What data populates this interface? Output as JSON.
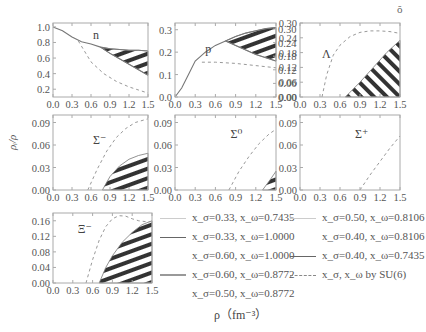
{
  "chart_data": [
    {
      "type": "line",
      "panel": "n",
      "label": "n",
      "xlim": [
        0,
        1.5
      ],
      "ylim": [
        0.1,
        1.05
      ],
      "xticks": [
        "0.0",
        "0.3",
        "0.6",
        "0.9",
        "1.2",
        "1.5"
      ],
      "yticks": [
        "0.2",
        "0.4",
        "0.6",
        "0.8",
        "1.0"
      ],
      "series": [
        {
          "name": "upper band edge",
          "x": [
            0,
            0.15,
            0.3,
            0.45,
            0.6,
            0.75,
            0.9,
            1.05,
            1.2,
            1.35,
            1.5
          ],
          "y": [
            1.0,
            0.95,
            0.87,
            0.81,
            0.78,
            0.74,
            0.72,
            0.71,
            0.7,
            0.7,
            0.69
          ]
        },
        {
          "name": "lower band edge",
          "x": [
            0.75,
            0.9,
            1.05,
            1.2,
            1.35,
            1.5
          ],
          "y": [
            0.74,
            0.66,
            0.59,
            0.52,
            0.45,
            0.38
          ]
        },
        {
          "name": "SU(6)",
          "x": [
            0.4,
            0.6,
            0.8,
            1.0,
            1.2,
            1.35,
            1.5
          ],
          "y": [
            0.82,
            0.55,
            0.4,
            0.3,
            0.23,
            0.19,
            0.15
          ]
        }
      ]
    },
    {
      "type": "line",
      "panel": "p",
      "label": "p",
      "xlim": [
        0,
        1.5
      ],
      "ylim": [
        0,
        0.33
      ],
      "xticks": [
        "0.0",
        "0.3",
        "0.6",
        "0.9",
        "1.2",
        "1.5"
      ],
      "yticks_left": [
        "0.0",
        "0.1",
        "0.2",
        "0.3"
      ],
      "yticks_right": [
        "0.00",
        "0.06",
        "0.12",
        "0.18",
        "0.24",
        "0.30"
      ],
      "series": [
        {
          "name": "upper band edge",
          "x": [
            0,
            0.1,
            0.2,
            0.3,
            0.45,
            0.6,
            0.75,
            0.9,
            1.05,
            1.2,
            1.35,
            1.5
          ],
          "y": [
            0.0,
            0.04,
            0.1,
            0.16,
            0.2,
            0.23,
            0.25,
            0.27,
            0.285,
            0.295,
            0.305,
            0.31
          ]
        },
        {
          "name": "lower band edge",
          "x": [
            0.75,
            0.9,
            1.05,
            1.2,
            1.35,
            1.5
          ],
          "y": [
            0.25,
            0.23,
            0.21,
            0.19,
            0.175,
            0.16
          ]
        },
        {
          "name": "SU(6)",
          "x": [
            0.4,
            0.6,
            0.9,
            1.2,
            1.5
          ],
          "y": [
            0.155,
            0.155,
            0.15,
            0.14,
            0.13
          ]
        }
      ]
    },
    {
      "type": "line",
      "panel": "Lambda",
      "label": "Λ",
      "xlim": [
        0,
        1.5
      ],
      "ylim": [
        0,
        0.3
      ],
      "xticks": [
        "0.0",
        "0.3",
        "0.6",
        "0.9",
        "1.2",
        "1.5"
      ],
      "yticks": [
        "0.00",
        "0.06",
        "0.12",
        "0.18",
        "0.24",
        "0.30"
      ],
      "series": [
        {
          "name": "band upper edge",
          "x": [
            0.68,
            0.9,
            1.1,
            1.3,
            1.5
          ],
          "y": [
            0.0,
            0.06,
            0.12,
            0.18,
            0.23
          ]
        },
        {
          "name": "SU(6)",
          "x": [
            0.33,
            0.4,
            0.5,
            0.6,
            0.75,
            0.9,
            1.05,
            1.2,
            1.35,
            1.5
          ],
          "y": [
            0.0,
            0.09,
            0.17,
            0.21,
            0.245,
            0.262,
            0.268,
            0.268,
            0.265,
            0.258
          ]
        }
      ]
    },
    {
      "type": "line",
      "panel": "Sigma-",
      "label": "Σ⁻",
      "xlim": [
        0,
        1.5
      ],
      "ylim": [
        0,
        0.1
      ],
      "xticks": [
        "0.0",
        "0.3",
        "0.6",
        "0.9",
        "1.2",
        "1.5"
      ],
      "yticks": [
        "0.00",
        "0.03",
        "0.06",
        "0.09"
      ],
      "series": [
        {
          "name": "band upper edge",
          "x": [
            0.78,
            0.9,
            1.05,
            1.2,
            1.35,
            1.5
          ],
          "y": [
            0.0,
            0.018,
            0.032,
            0.041,
            0.046,
            0.049
          ]
        },
        {
          "name": "SU(6)",
          "x": [
            0.55,
            0.7,
            0.85,
            1.0,
            1.15,
            1.3,
            1.5
          ],
          "y": [
            0.0,
            0.028,
            0.052,
            0.07,
            0.082,
            0.09,
            0.095
          ]
        }
      ]
    },
    {
      "type": "line",
      "panel": "Sigma0",
      "label": "Σ⁰",
      "xlim": [
        0,
        1.5
      ],
      "ylim": [
        0,
        0.1
      ],
      "xticks": [
        "0.0",
        "0.3",
        "0.6",
        "0.9",
        "1.2",
        "1.5"
      ],
      "yticks": [
        "0.00",
        "0.03",
        "0.06",
        "0.09"
      ],
      "series": [
        {
          "name": "band upper edge",
          "x": [
            1.3,
            1.4,
            1.5
          ],
          "y": [
            0.0,
            0.012,
            0.025
          ]
        },
        {
          "name": "SU(6)",
          "x": [
            0.8,
            0.95,
            1.1,
            1.25,
            1.4,
            1.5
          ],
          "y": [
            0.0,
            0.025,
            0.045,
            0.062,
            0.075,
            0.081
          ]
        }
      ]
    },
    {
      "type": "line",
      "panel": "Sigma+",
      "label": "Σ⁺",
      "xlim": [
        0,
        1.5
      ],
      "ylim": [
        0,
        0.1
      ],
      "xticks": [
        "0.0",
        "0.3",
        "0.6",
        "0.9",
        "1.2",
        "1.5"
      ],
      "yticks": [
        "0.00",
        "0.03",
        "0.06",
        "0.09"
      ],
      "series": [
        {
          "name": "SU(6)",
          "x": [
            0.9,
            1.05,
            1.2,
            1.35,
            1.5
          ],
          "y": [
            0.0,
            0.02,
            0.038,
            0.056,
            0.072
          ]
        }
      ]
    },
    {
      "type": "line",
      "panel": "Xi-",
      "label": "Ξ⁻",
      "xlim": [
        0,
        1.5
      ],
      "ylim": [
        0,
        0.18
      ],
      "xticks": [
        "0.0",
        "0.3",
        "0.6",
        "0.9",
        "1.2",
        "1.5"
      ],
      "yticks": [
        "0.00",
        "0.04",
        "0.08",
        "0.12",
        "0.16"
      ],
      "series": [
        {
          "name": "band upper edge",
          "x": [
            0.7,
            0.8,
            0.9,
            1.05,
            1.2,
            1.35,
            1.5
          ],
          "y": [
            0.0,
            0.04,
            0.07,
            0.105,
            0.13,
            0.15,
            0.16
          ]
        },
        {
          "name": "SU(6)",
          "x": [
            0.5,
            0.6,
            0.7,
            0.8,
            0.9,
            1.0,
            1.1,
            1.2,
            1.3,
            1.4,
            1.5
          ],
          "y": [
            0.0,
            0.06,
            0.11,
            0.145,
            0.165,
            0.173,
            0.172,
            0.165,
            0.16,
            0.158,
            0.158
          ]
        }
      ]
    }
  ],
  "axes": {
    "xlabel": "ρ（fm⁻³）",
    "ylabel": "ρᵢ/ρ"
  },
  "legend": {
    "col1": [
      {
        "label": "x_σ=0.33, x_ω=0.7435",
        "style": "thin-gray"
      },
      {
        "label": "x_σ=0.33, x_ω=1.0000",
        "style": "solid"
      },
      {
        "label": "x_σ=0.60, x_ω=1.0000",
        "style": "none"
      },
      {
        "label": "x_σ=0.60, x_ω=0.8772",
        "style": "thick-gray"
      },
      {
        "label": "x_σ=0.50, x_ω=0.8772",
        "style": "none"
      }
    ],
    "col2": [
      {
        "label": "x_σ=0.50, x_ω=0.8106",
        "style": "thin-gray"
      },
      {
        "label": "x_σ=0.40, x_ω=0.8106",
        "style": "none"
      },
      {
        "label": "x_σ=0.40, x_ω=0.7435",
        "style": "solid"
      },
      {
        "label": "x_σ, x_ω by SU(6)",
        "style": "dashed"
      }
    ]
  },
  "corner_mark": "ŏ"
}
